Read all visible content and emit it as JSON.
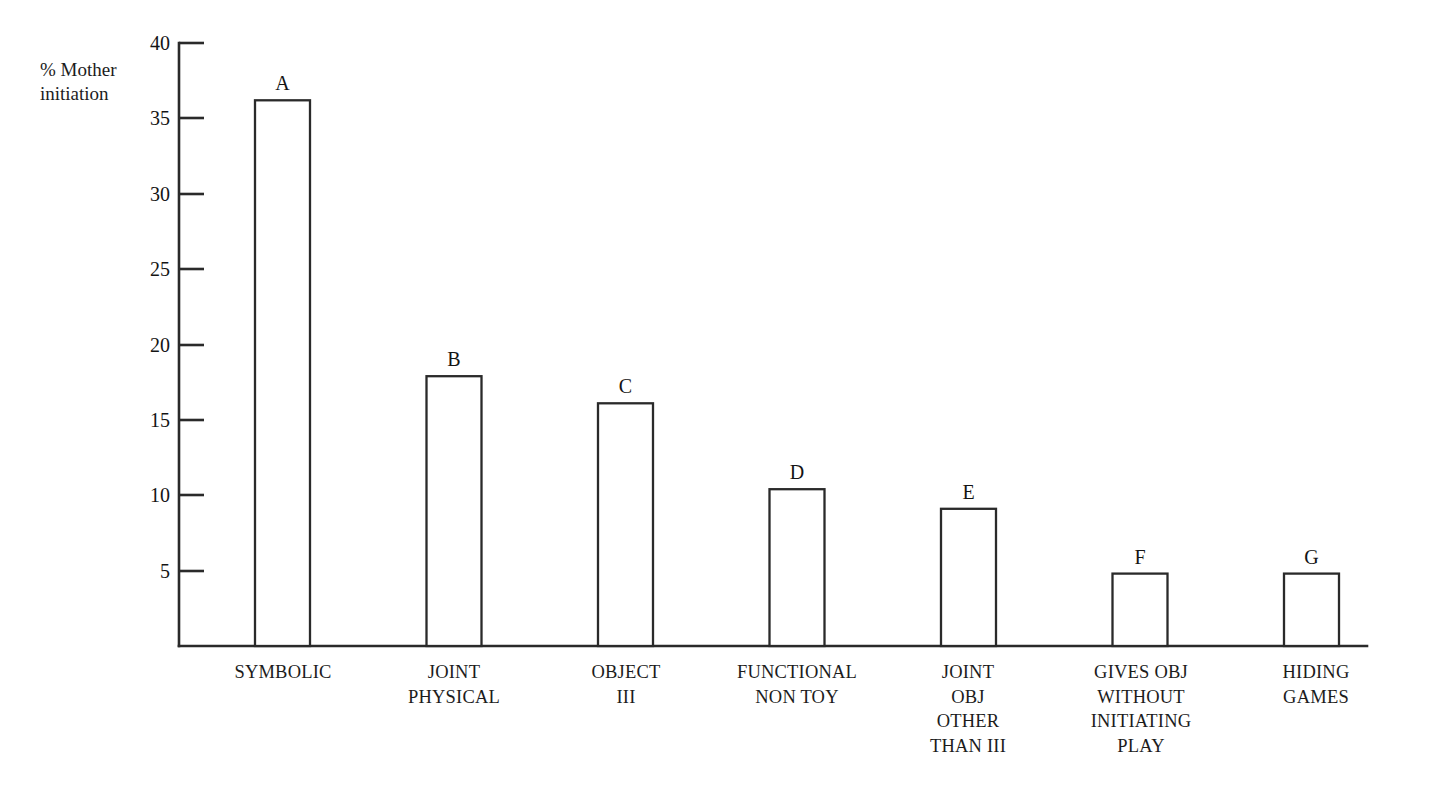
{
  "chart_data": {
    "type": "bar",
    "title": "",
    "subtitle": "",
    "xlabel": "",
    "ylabel": "% Mother\ninitiation",
    "ylim": [
      0,
      40
    ],
    "ytick_values": [
      5,
      10,
      15,
      20,
      25,
      30,
      35,
      40
    ],
    "ytick_labels": [
      "5",
      "10",
      "15",
      "20",
      "25",
      "30",
      "35",
      "40"
    ],
    "grid": false,
    "legend": "none",
    "bar_style": "outlined-white",
    "categories": [
      "SYMBOLIC",
      "JOINT\nPHYSICAL",
      "OBJECT\nIII",
      "FUNCTIONAL\nNON TOY",
      "JOINT\nOBJ\nOTHER\nTHAN III",
      "GIVES OBJ\nWITHOUT\nINITIATING\nPLAY",
      "HIDING\nGAMES"
    ],
    "point_labels": [
      "A",
      "B",
      "C",
      "D",
      "E",
      "F",
      "G"
    ],
    "values": [
      36.2,
      17.9,
      16.1,
      10.4,
      9.1,
      4.8,
      4.8
    ]
  },
  "bars": [
    {
      "letter": "A",
      "value": 36.2,
      "category": "SYMBOLIC"
    },
    {
      "letter": "B",
      "value": 17.9,
      "category": "JOINT\nPHYSICAL"
    },
    {
      "letter": "C",
      "value": 16.1,
      "category": "OBJECT\nIII"
    },
    {
      "letter": "D",
      "value": 10.4,
      "category": "FUNCTIONAL\nNON TOY"
    },
    {
      "letter": "E",
      "value": 9.1,
      "category": "JOINT\nOBJ\nOTHER\nTHAN III"
    },
    {
      "letter": "F",
      "value": 4.8,
      "category": "GIVES OBJ\nWITHOUT\nINITIATING\nPLAY"
    },
    {
      "letter": "G",
      "value": 4.8,
      "category": "HIDING\nGAMES"
    }
  ],
  "axis": {
    "y_label_text": "% Mother\ninitiation",
    "ticks": [
      "40",
      "35",
      "30",
      "25",
      "20",
      "15",
      "10",
      "5"
    ]
  },
  "colors": {
    "background": "#ffffff",
    "ink": "#2a2a2a",
    "text": "#1c1c1c",
    "bar_fill": "#ffffff"
  }
}
